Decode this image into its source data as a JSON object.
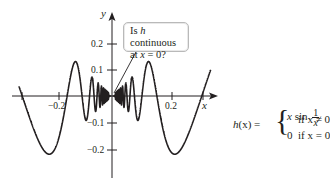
{
  "chart_data": {
    "type": "line",
    "title": "",
    "function": "h(x) = x sin(1/x) for x ≠ 0; h(0) = 0",
    "xlabel": "x",
    "ylabel": "y",
    "x_range": [
      -0.33,
      0.35
    ],
    "ylim": [
      -0.25,
      0.25
    ],
    "x_ticks": [
      {
        "value": -0.3183,
        "label": ""
      },
      {
        "value": -0.2,
        "label": "−0.2"
      },
      {
        "value": 0.2,
        "label": "0.2"
      },
      {
        "value": 0.3183,
        "label": ""
      }
    ],
    "y_ticks": [
      {
        "value": 0.2,
        "label": "0.2"
      },
      {
        "value": 0.1,
        "label": "0.1"
      },
      {
        "value": -0.1,
        "label": "−0.1"
      },
      {
        "value": -0.2,
        "label": "−0.2"
      }
    ],
    "grid": false,
    "legend": null,
    "series": [
      {
        "name": "h(x) = x sin(1/x)",
        "color": "#231f20",
        "sample_points": [
          {
            "x": -0.3,
            "y": 0.0571
          },
          {
            "x": -0.2,
            "y": 0.1918
          },
          {
            "x": -0.1,
            "y": -0.0544
          },
          {
            "x": 0.0,
            "y": 0.0
          },
          {
            "x": 0.1,
            "y": -0.0544
          },
          {
            "x": 0.2,
            "y": -0.1918
          },
          {
            "x": 0.3,
            "y": -0.0571
          }
        ]
      }
    ],
    "annotations": [
      {
        "text": "Is h continuous at x = 0?",
        "points_to": {
          "x": 0,
          "y": 0
        }
      }
    ]
  },
  "axes": {
    "x_name": "x",
    "y_name": "y",
    "x_tick_labels": [
      "−0.2",
      "0.2"
    ],
    "y_tick_labels": [
      "0.2",
      "0.1",
      "−0.1",
      "−0.2"
    ]
  },
  "callout": {
    "line1_prefix": "Is ",
    "line1_var": "h",
    "line1_suffix": " continuous",
    "line2_prefix": "at ",
    "line2_var": "x",
    "line2_suffix": " = 0?"
  },
  "formula": {
    "lhs_func": "h",
    "lhs_arg": "(x)",
    "equals": " =",
    "brace": "{",
    "case1_expr_var": "x",
    "case1_expr_fn": " sin",
    "case1_frac_num": "1",
    "case1_frac_den": "x",
    "case1_cond": "if x ≠ 0",
    "case2_expr": "0",
    "case2_cond": "if x = 0"
  }
}
